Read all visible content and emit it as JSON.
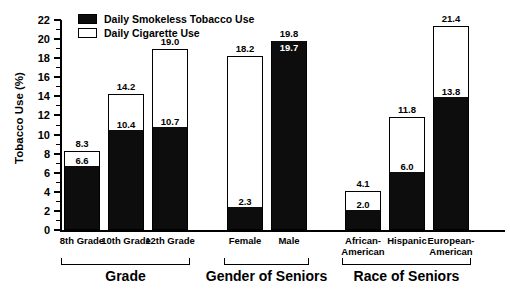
{
  "chart_data": {
    "type": "bar",
    "title": "",
    "xlabel": "",
    "ylabel": "Tobacco Use (%)",
    "ylim": [
      0,
      22
    ],
    "ytick_step": 2,
    "yticks": [
      0,
      2,
      4,
      6,
      8,
      10,
      12,
      14,
      16,
      18,
      20,
      22
    ],
    "ytick_labels": [
      "0",
      "2",
      "4",
      "6",
      "8",
      "10",
      "12",
      "14",
      "16",
      "18",
      "20",
      "22"
    ],
    "grid": false,
    "stacked": false,
    "legend_position": "top-left",
    "legend": [
      {
        "name": "Daily Smokeless Tobacco Use",
        "swatch": "filled"
      },
      {
        "name": "Daily Cigarette Use",
        "swatch": "hollow"
      }
    ],
    "categories": [
      "8th Grade",
      "10th Grade",
      "12th Grade",
      "Female",
      "Male",
      "African-\nAmerican",
      "Hispanic",
      "European-\nAmerican"
    ],
    "series": [
      {
        "name": "Daily Cigarette Use",
        "values": [
          8.3,
          14.2,
          19.0,
          18.2,
          19.8,
          4.1,
          11.8,
          21.4
        ]
      },
      {
        "name": "Daily Smokeless Tobacco Use",
        "values": [
          6.6,
          10.4,
          10.7,
          2.3,
          19.7,
          2.0,
          6.0,
          13.8
        ]
      }
    ],
    "groups": [
      {
        "label": "Grade",
        "categories": [
          "8th Grade",
          "10th Grade",
          "12th Grade"
        ]
      },
      {
        "label": "Gender of Seniors",
        "categories": [
          "Female",
          "Male"
        ]
      },
      {
        "label": "Race of Seniors",
        "categories": [
          "African-American",
          "Hispanic",
          "European-American"
        ]
      }
    ],
    "colors": {
      "smokeless": "#0d0d0d",
      "cigarette": "#ffffff",
      "axis": "#000000"
    }
  },
  "bars": [
    {
      "cat": "8th Grade",
      "total": "8.3",
      "black": "6.6",
      "total_num": 8.3,
      "black_num": 6.6
    },
    {
      "cat": "10th Grade",
      "total": "14.2",
      "black": "10.4",
      "total_num": 14.2,
      "black_num": 10.4
    },
    {
      "cat": "12th Grade",
      "total": "19.0",
      "black": "10.7",
      "total_num": 19.0,
      "black_num": 10.7
    },
    {
      "cat": "Female",
      "total": "18.2",
      "black": "2.3",
      "total_num": 18.2,
      "black_num": 2.3
    },
    {
      "cat": "Male",
      "total": "19.8",
      "black": "19.7",
      "total_num": 19.8,
      "black_num": 19.7
    },
    {
      "cat": "African-\nAmerican",
      "total": "4.1",
      "black": "2.0",
      "total_num": 4.1,
      "black_num": 2.0
    },
    {
      "cat": "Hispanic",
      "total": "11.8",
      "black": "6.0",
      "total_num": 11.8,
      "black_num": 6.0
    },
    {
      "cat": "European-\nAmerican",
      "total": "21.4",
      "black": "13.8",
      "total_num": 21.4,
      "black_num": 13.8
    }
  ],
  "axis": {
    "ylabel": "Tobacco Use (%)",
    "ticks": [
      "22",
      "20",
      "18",
      "16",
      "14",
      "12",
      "10",
      "8",
      "6",
      "4",
      "2",
      "0"
    ]
  },
  "legend": {
    "smokeless_label": "Daily Smokeless Tobacco Use",
    "cigarette_label": "Daily Cigarette Use"
  },
  "groups": [
    {
      "label": "Grade"
    },
    {
      "label": "Gender of Seniors"
    },
    {
      "label": "Race of Seniors"
    }
  ]
}
